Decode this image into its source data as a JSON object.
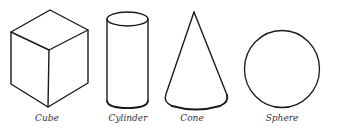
{
  "figure": {
    "shapes": [
      {
        "id": "cube",
        "label": "Cube"
      },
      {
        "id": "cylinder",
        "label": "Cylinder"
      },
      {
        "id": "cone",
        "label": "Cone"
      },
      {
        "id": "sphere",
        "label": "Sphere"
      }
    ],
    "colors": {
      "stroke": "#1a1a1a",
      "label": "#333333",
      "background": "#ffffff"
    }
  }
}
